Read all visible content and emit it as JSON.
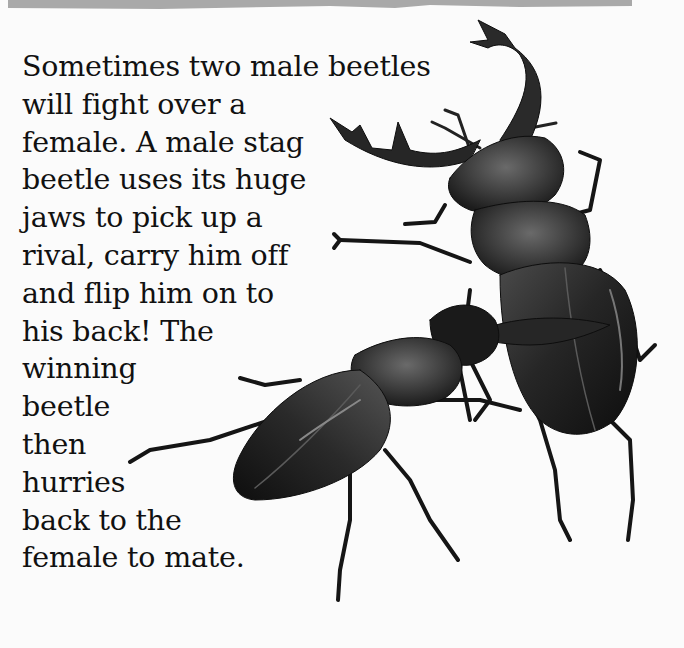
{
  "page": {
    "top_band_color": "#a9a9a9",
    "background_color": "#fbfbfb",
    "text_color": "#111111"
  },
  "body_text": {
    "full": "Sometimes two male beetles will fight over a female. A male stag beetle uses its huge jaws to pick up a rival, carry him off and flip him on to his back! The winning beetle then hurries back to the female to mate.",
    "lines": [
      "Sometimes two male beetles",
      "will fight over a",
      "female. A male stag",
      "beetle uses its huge",
      "jaws to pick up a",
      "rival, carry him off",
      "and flip him on to",
      "his back! The",
      "winning",
      "beetle",
      "then",
      "hurries",
      "back to the",
      "female to mate."
    ]
  },
  "illustration": {
    "subject": "two male stag beetles fighting",
    "beetles": [
      {
        "role": "winner",
        "description": "upright stag beetle with large antler-like jaws lifting rival"
      },
      {
        "role": "rival",
        "description": "stag beetle being lifted and flipped"
      }
    ],
    "ink_color": "#1a1a1a",
    "highlight_color": "#5a5a5a"
  }
}
